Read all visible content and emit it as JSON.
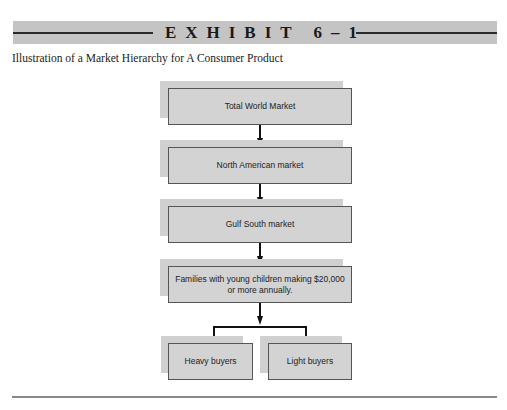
{
  "exhibit": {
    "title": "EXHIBIT 6–1",
    "caption": "Illustration of a Market Hierarchy for A Consumer Product"
  },
  "hierarchy": {
    "levels": [
      {
        "label": "Total World Market"
      },
      {
        "label": "North American market"
      },
      {
        "label": "Gulf South market"
      },
      {
        "label": "Families with young children making $20,000 or more annually."
      }
    ],
    "leaves": [
      {
        "label": "Heavy buyers"
      },
      {
        "label": "Light buyers"
      }
    ]
  },
  "colors": {
    "banner": "#c4c4c4",
    "node_fill": "#d3d3d3",
    "node_border": "#555555"
  }
}
